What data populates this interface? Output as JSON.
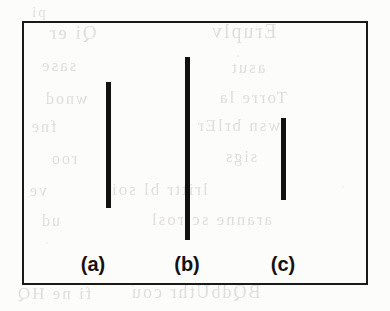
{
  "figure": {
    "caption_labels": [
      "(a)",
      "(b)",
      "(c)"
    ],
    "frame": {
      "x": 22,
      "y": 21,
      "width": 346,
      "height": 264,
      "border_width": 2,
      "border_color": "#1a1a1a",
      "background_color": "#ffffff"
    },
    "bar_color": "#111111",
    "background_color": "#fcfcfb"
  },
  "chart_data": {
    "type": "bar",
    "title": "",
    "subtitle": "",
    "xlabel": "",
    "ylabel": "",
    "orientation": "vertical",
    "grid": false,
    "legend": null,
    "axis_visible": false,
    "categories": [
      "(a)",
      "(b)",
      "(c)"
    ],
    "values": [
      126,
      183,
      82
    ],
    "value_units": "px",
    "ylim": [
      0,
      264
    ],
    "bar_width_px": 5,
    "bars": [
      {
        "label": "(a)",
        "center_x": 108,
        "top_y": 82,
        "bottom_y": 208,
        "length_px": 126,
        "width_px": 5,
        "color": "#111111",
        "label_center_x": 93,
        "label_baseline_y": 270
      },
      {
        "label": "(b)",
        "center_x": 187,
        "top_y": 57,
        "bottom_y": 240,
        "length_px": 183,
        "width_px": 5,
        "color": "#111111",
        "label_center_x": 187,
        "label_baseline_y": 270
      },
      {
        "label": "(c)",
        "center_x": 283,
        "top_y": 118,
        "bottom_y": 200,
        "length_px": 82,
        "width_px": 5,
        "color": "#111111",
        "label_center_x": 283,
        "label_baseline_y": 270
      }
    ]
  },
  "bleed_through": {
    "note": "faint mirrored text showing through from reverse side of scanned page",
    "color": "#c9c6c2",
    "lines": [
      {
        "text": "pi",
        "top": 4,
        "left": 30,
        "size": 15
      },
      {
        "text": "Qi er",
        "top": 22,
        "left": 48,
        "size": 19
      },
      {
        "text": "Eruplv",
        "top": 20,
        "left": 210,
        "size": 20
      },
      {
        "text": "sase",
        "top": 56,
        "left": 40,
        "size": 17
      },
      {
        "text": "asut",
        "top": 58,
        "left": 230,
        "size": 17
      },
      {
        "text": "wnod",
        "top": 90,
        "left": 44,
        "size": 16
      },
      {
        "text": "Torre la",
        "top": 88,
        "left": 218,
        "size": 17
      },
      {
        "text": "fne",
        "top": 118,
        "left": 30,
        "size": 16
      },
      {
        "text": "wsn brlEr",
        "top": 116,
        "left": 196,
        "size": 17
      },
      {
        "text": "roo",
        "top": 150,
        "left": 50,
        "size": 16
      },
      {
        "text": "sigs",
        "top": 148,
        "left": 224,
        "size": 16
      },
      {
        "text": "ve",
        "top": 182,
        "left": 28,
        "size": 16
      },
      {
        "text": "lrittr bl soi",
        "top": 180,
        "left": 110,
        "size": 17
      },
      {
        "text": "ud",
        "top": 212,
        "left": 40,
        "size": 16
      },
      {
        "text": "aranne sctrosl",
        "top": 210,
        "left": 150,
        "size": 17
      },
      {
        "text": "fi ne  HQ",
        "top": 284,
        "left": 16,
        "size": 17
      },
      {
        "text": "BQdbUthr cou",
        "top": 282,
        "left": 130,
        "size": 18
      }
    ]
  }
}
